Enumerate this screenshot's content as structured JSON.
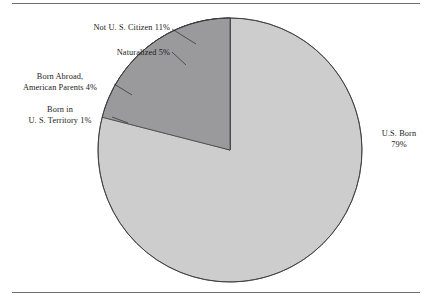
{
  "figure": {
    "background_color": "#ffffff",
    "rule_color": "#6e6e72"
  },
  "chart_data": {
    "type": "pie",
    "title": "",
    "subtitle": "",
    "xlabel": "",
    "ylabel": "",
    "grid": false,
    "legend_position": "none",
    "labels_position": "outside-callout",
    "start_angle_deg": 90,
    "direction": "clockwise-for-first-slice",
    "units": "percent",
    "total": 100,
    "categories": [
      "U.S. Born",
      "Not U. S. Citizen",
      "Naturalized",
      "Born Abroad, American Parents",
      "Born in U. S. Territory"
    ],
    "values": [
      79,
      11,
      5,
      4,
      1
    ],
    "colors": [
      "#cdcdcd",
      "#555558",
      "#ffffff",
      "#555558",
      "#9a9a9d"
    ],
    "slices": [
      {
        "name": "us-born",
        "label_lines": [
          "U.S. Born",
          "79%"
        ],
        "value": 79,
        "value_text": "79%",
        "color": "#cdcdcd"
      },
      {
        "name": "not-us-citizen",
        "label_lines": [
          "Not U. S. Citizen 11%"
        ],
        "value": 11,
        "value_text": "11%",
        "color": "#555558"
      },
      {
        "name": "naturalized",
        "label_lines": [
          "Naturalized 5%"
        ],
        "value": 5,
        "value_text": "5%",
        "color": "#ffffff"
      },
      {
        "name": "born-abroad-american-parents",
        "label_lines": [
          "Born Abroad,",
          "American Parents 4%"
        ],
        "value": 4,
        "value_text": "4%",
        "color": "#555558"
      },
      {
        "name": "born-in-us-territory",
        "label_lines": [
          "Born in",
          "U. S. Territory 1%"
        ],
        "value": 1,
        "value_text": "1%",
        "color": "#9a9a9d"
      }
    ]
  },
  "labels": {
    "not_citizen": "Not U. S. Citizen 11%",
    "naturalized": "Naturalized 5%",
    "born_abroad_line1": "Born Abroad,",
    "born_abroad_line2": "American Parents 4%",
    "territory_line1": "Born in",
    "territory_line2": "U. S. Territory 1%",
    "us_born_line1": "U.S. Born",
    "us_born_line2": "79%"
  }
}
